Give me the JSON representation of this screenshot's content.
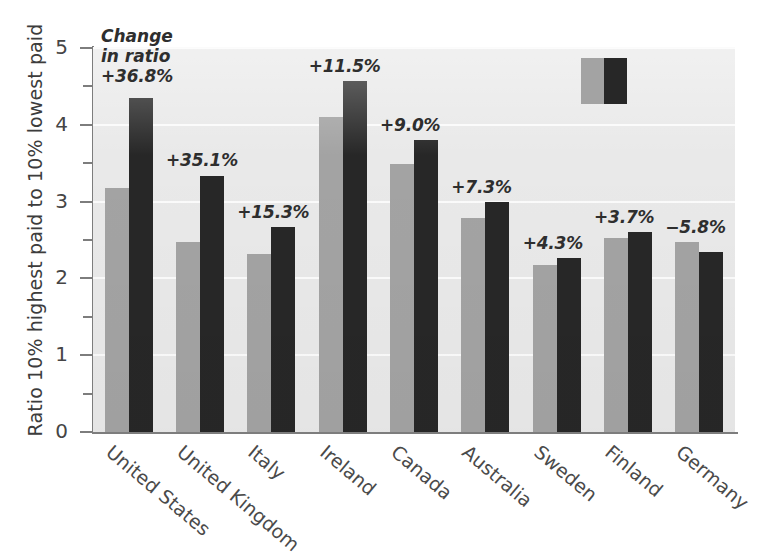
{
  "chart_data": {
    "type": "bar",
    "title": "",
    "subtitle": "",
    "xlabel": "",
    "ylabel": "Ratio 10% highest paid to 10% lowest paid",
    "ylim": [
      0,
      5
    ],
    "yticks": [
      0,
      1,
      2,
      3,
      4,
      5
    ],
    "ytick_labels": [
      "0",
      "1",
      "2",
      "3",
      "4",
      "5"
    ],
    "minor_yticks": [
      0.5,
      1.5,
      2.5,
      3.5,
      4.5
    ],
    "grid": "horizontal white gridlines on light gray panel",
    "legend": {
      "position": "top-right inside panel",
      "entries": [
        {
          "name": "earlier year",
          "color": "#a3a3a3"
        },
        {
          "name": "later year",
          "color": "#272727"
        }
      ],
      "labels_visible": false
    },
    "categories": [
      "United States",
      "United Kingdom",
      "Italy",
      "Ireland",
      "Canada",
      "Australia",
      "Sweden",
      "Finland",
      "Germany"
    ],
    "series": [
      {
        "name": "earlier",
        "color": "#a3a3a3",
        "values": [
          3.18,
          2.47,
          2.32,
          4.1,
          3.49,
          2.79,
          2.18,
          2.52,
          2.48
        ]
      },
      {
        "name": "later",
        "color": "#272727",
        "values": [
          4.35,
          3.34,
          2.67,
          4.57,
          3.8,
          2.99,
          2.27,
          2.61,
          2.34
        ]
      }
    ],
    "annotations": [
      "+36.8%",
      "+35.1%",
      "+15.3%",
      "+11.5%",
      "+9.0%",
      "+7.3%",
      "+4.3%",
      "+3.7%",
      "−5.8%"
    ],
    "annotation_caption": [
      "Change",
      "in ratio"
    ]
  },
  "caption": {
    "line1": "Change",
    "line2": "in ratio"
  },
  "axis": {
    "ylabel": "Ratio 10% highest paid to 10% lowest paid"
  },
  "colors": {
    "panel": "#e9e9e9",
    "grid": "#fbfbfb",
    "bar_light": "#a3a3a3",
    "bar_dark": "#272727",
    "axis": "#7d7d7d",
    "text": "#3a3a3a"
  }
}
